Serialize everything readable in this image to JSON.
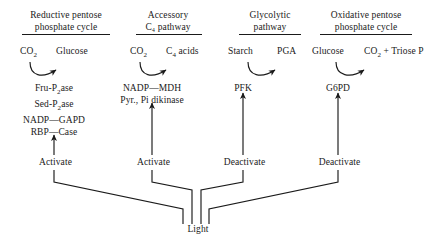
{
  "diagram": {
    "title_hidden": "Light regulation of enzymes in plant metabolic pathways",
    "light_node_label": "Light",
    "columns": [
      {
        "id": "reductive-pentose-phosphate-cycle",
        "header_line1": "Reductive pentose",
        "header_line2": "phosphate cycle",
        "substrate": "CO",
        "substrate_sub": "2",
        "product": "Glucose",
        "product_sub": "",
        "product_tail": "",
        "enzymes": [
          {
            "pre": "Fru-P",
            "sub": "2",
            "post": "ase",
            "link": ""
          },
          {
            "pre": "Sed-P",
            "sub": "2",
            "post": "ase",
            "link": ""
          },
          {
            "pre": "NADP",
            "sub": "",
            "post": "GAPD",
            "link": "—"
          },
          {
            "pre": "RBP",
            "sub": "",
            "post": "Case",
            "link": "—"
          }
        ],
        "regulation": "Activate"
      },
      {
        "id": "accessory-c4-pathway",
        "header_line1": "Accessory",
        "header_line2": "C₄ pathway",
        "substrate": "CO",
        "substrate_sub": "2",
        "product": "C",
        "product_sub": "4",
        "product_tail": " acids",
        "enzymes": [
          {
            "pre": "NADP",
            "sub": "",
            "post": "MDH",
            "link": "—"
          },
          {
            "pre": "Pyr., Pi dikinase",
            "sub": "",
            "post": "",
            "link": ""
          }
        ],
        "regulation": "Activate"
      },
      {
        "id": "glycolytic-pathway",
        "header_line1": "Glycolytic",
        "header_line2": "pathway",
        "substrate": "Starch",
        "substrate_sub": "",
        "product": "PGA",
        "product_sub": "",
        "product_tail": "",
        "enzymes": [
          {
            "pre": "PFK",
            "sub": "",
            "post": "",
            "link": ""
          }
        ],
        "regulation": "Deactivate"
      },
      {
        "id": "oxidative-pentose-phosphate-cycle",
        "header_line1": "Oxidative pentose",
        "header_line2": "phosphate cycle",
        "substrate": "Glucose",
        "substrate_sub": "",
        "product": "CO",
        "product_sub": "2",
        "product_tail": " + Triose P",
        "enzymes": [
          {
            "pre": "G6PD",
            "sub": "",
            "post": "",
            "link": ""
          }
        ],
        "regulation": "Deactivate"
      }
    ]
  },
  "style": {
    "line_color": "#1a1a1a",
    "background": "#ffffff"
  }
}
